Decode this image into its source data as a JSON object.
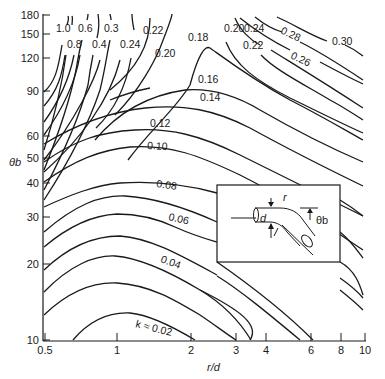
{
  "chart_data": {
    "type": "contour",
    "title": "",
    "xlabel": "r/d",
    "ylabel": "θb",
    "xscale": "log",
    "yscale": "log",
    "xlim": [
      0.5,
      10
    ],
    "ylim": [
      10,
      180
    ],
    "grid": false,
    "x_ticks": [
      {
        "value": 0.5,
        "label": "0.5",
        "px": 45
      },
      {
        "value": 1,
        "label": "1",
        "px": 117
      },
      {
        "value": 2,
        "label": "2",
        "px": 191
      },
      {
        "value": 3,
        "label": "3",
        "px": 236
      },
      {
        "value": 4,
        "label": "4",
        "px": 266
      },
      {
        "value": 6,
        "label": "6",
        "px": 311
      },
      {
        "value": 8,
        "label": "8",
        "px": 341
      },
      {
        "value": 10,
        "label": "10",
        "px": 365
      }
    ],
    "y_ticks": [
      {
        "value": 180,
        "label": "180",
        "py": 15
      },
      {
        "value": 150,
        "label": "150",
        "py": 34
      },
      {
        "value": 120,
        "label": "120",
        "py": 58
      },
      {
        "value": 90,
        "label": "90",
        "py": 91
      },
      {
        "value": 60,
        "label": "60",
        "py": 136
      },
      {
        "value": 50,
        "label": "50",
        "py": 158
      },
      {
        "value": 40,
        "label": "40",
        "py": 183
      },
      {
        "value": 30,
        "label": "30",
        "py": 217
      },
      {
        "value": 20,
        "label": "20",
        "py": 264
      },
      {
        "value": 10,
        "label": "10",
        "py": 340
      }
    ],
    "contour_levels": [
      0.02,
      0.04,
      0.06,
      0.08,
      0.1,
      0.12,
      0.14,
      0.16,
      0.18,
      0.2,
      0.22,
      0.24,
      0.26,
      0.28,
      0.3,
      0.3,
      0.4,
      0.6,
      0.8,
      1.0
    ],
    "series": [
      {
        "name": "k ≈ 0.02",
        "level": 0.02,
        "label": "k ≈ 0.02",
        "label_pos": [
          135,
          327
        ],
        "label_rot": 14,
        "path": "M73,340 C90,320 110,312 130,313 C150,315 175,328 195,340"
      },
      {
        "level": 0.04,
        "label": "0.04",
        "label_pos": [
          160,
          262
        ],
        "label_rot": 20,
        "path": "M44,292 C70,265 95,255 115,256 C140,258 170,272 200,290 C240,310 260,325 250,340"
      },
      {
        "level": 0.04,
        "label": "",
        "path": "M200,290 C225,305 240,322 251,340"
      },
      {
        "level": 0.06,
        "label": "0.06",
        "label_pos": [
          168,
          220
        ],
        "label_rot": 13,
        "path": "M44,247 C70,225 95,215 117,214 C140,214 160,220 175,227 C195,236 210,240 217,242"
      },
      {
        "level": 0.06,
        "label": "",
        "path": "M340,262 C355,270 360,285 363,295"
      },
      {
        "level": 0.06,
        "label": "",
        "path": "M217,262 C250,285 285,312 313,340"
      },
      {
        "level": 0.08,
        "label": "0.08",
        "label_pos": [
          156,
          187
        ],
        "label_rot": 8,
        "path": "M44,207 C70,195 95,185 120,183 C150,181 185,184 217,193"
      },
      {
        "level": 0.08,
        "label": "",
        "path": "M340,232 C350,240 357,250 363,258"
      },
      {
        "level": 0.1,
        "label": "0.10",
        "label_pos": [
          147,
          149
        ],
        "label_rot": 3,
        "path": "M44,182 C75,160 100,150 130,147 C170,144 200,156 240,175 C290,200 330,228 363,250"
      },
      {
        "level": 0.12,
        "label": "0.12",
        "label_pos": [
          150,
          127
        ],
        "label_rot": 0,
        "path": "M44,162 C75,140 100,132 135,130 C170,128 200,135 240,155 C290,180 330,200 363,216"
      },
      {
        "level": 0.14,
        "label": "0.14",
        "label_pos": [
          200,
          101
        ],
        "label_rot": 0,
        "path": "M44,144 C75,125 110,112 145,108 C185,104 215,110 250,128 C290,150 330,170 363,186"
      },
      {
        "level": 0.16,
        "label": "0.16",
        "label_pos": [
          198,
          83
        ],
        "label_rot": 0,
        "path": "M95,140 C120,110 150,95 185,90 C210,88 235,95 260,110 C300,133 335,150 363,162"
      },
      {
        "level": 0.18,
        "label": "0.18",
        "label_pos": [
          188,
          41
        ],
        "label_rot": 0,
        "path": "M128,160 C150,130 175,110 190,85 C198,55 205,45 210,48 C220,55 250,78 290,100 C325,118 345,130 363,140"
      },
      {
        "level": 0.2,
        "label": "0.20",
        "label_pos": [
          155,
          57
        ],
        "label_rot": 0,
        "path": "M110,90 C135,70 150,45 150,18"
      },
      {
        "level": 0.2,
        "label": "0.20",
        "label_pos": [
          224,
          32
        ],
        "label_rot": 0,
        "path": "M226,42 C235,65 255,80 290,98 C325,115 345,125 363,133"
      },
      {
        "level": 0.22,
        "label": "0.22",
        "label_pos": [
          143,
          34
        ],
        "label_rot": 0,
        "path": "M115,115 C140,90 155,60 160,48 C165,35 172,18 172,14"
      },
      {
        "level": 0.22,
        "label": "0.22",
        "label_pos": [
          243,
          49
        ],
        "label_rot": 0,
        "path": "M261,55 C275,70 305,85 330,100 C345,108 355,115 363,120"
      },
      {
        "level": 0.24,
        "label": "0.24",
        "label_pos": [
          120,
          48
        ],
        "label_rot": 0,
        "path": "M96,128 C120,105 128,75 131,58 M134,30 C133,25 132,18 132,14"
      },
      {
        "level": 0.24,
        "label": "0.24",
        "label_pos": [
          244,
          32
        ],
        "label_rot": 0,
        "path": "M235,18 C240,30 250,40 260,45 M271,50 C295,65 320,80 363,108"
      },
      {
        "level": 0.26,
        "label": "0.26",
        "label_pos": [
          290,
          58
        ],
        "label_rot": 25,
        "path": "M240,18 C255,30 270,40 290,50 M320,62 C335,70 350,78 363,84"
      },
      {
        "level": 0.28,
        "label": "0.28",
        "label_pos": [
          280,
          33
        ],
        "label_rot": 25,
        "path": "M255,17 C265,25 275,30 282,32 M300,42 C320,52 345,68 363,80"
      },
      {
        "level": 0.3,
        "label": "0.30",
        "label_pos": [
          332,
          45
        ],
        "label_rot": 0,
        "path": "M277,17 C295,25 310,35 327,41 M345,45 C352,48 358,52 363,56"
      },
      {
        "level": 0.3,
        "label": "0.3",
        "label_pos": [
          104,
          32
        ],
        "label_rot": 0,
        "path": "M44,200 C70,160 90,120 100,90 C105,70 108,48 110,40 M111,20 C111,17 110,15 110,14"
      },
      {
        "level": 0.4,
        "label": "0.4",
        "label_pos": [
          92,
          48
        ],
        "label_rot": 0,
        "path": "M44,190 C65,150 80,115 88,85 C90,70 92,60 93,55"
      },
      {
        "level": 0.4,
        "label": "",
        "path": "M98,14 C99,20 99,30 97,38"
      },
      {
        "level": 0.6,
        "label": "0.6",
        "label_pos": [
          78,
          32
        ],
        "label_rot": 0,
        "path": "M44,170 C60,130 70,100 76,70 C78,58 80,48 82,40 M87,20 C88,17 88,15 88,14"
      },
      {
        "level": 0.8,
        "label": "0.8",
        "label_pos": [
          67,
          48
        ],
        "label_rot": 0,
        "path": "M44,150 C55,115 62,85 66,55 M72,16 C73,18 72,22 72,25"
      },
      {
        "level": 1.0,
        "label": "1.0",
        "label_pos": [
          56,
          32
        ],
        "label_rot": 0,
        "path": "M44,92 C55,82 58,70 62,45 M68,16 C69,18 68,22 67,25"
      }
    ],
    "extra_curves": [
      "M44,106 C58,90 62,75 65,55",
      "M44,122 C60,100 70,75 74,55",
      "M44,135 C62,110 75,85 80,55",
      "M44,160 C75,120 95,80 100,60",
      "M44,172 C80,140 110,100 120,60",
      "M44,232 C75,205 100,195 125,196 C160,198 195,212 217,222",
      "M44,270 C70,245 95,236 120,236 C150,238 180,255 217,275",
      "M44,315 C70,290 95,282 117,283 C150,285 175,300 200,315 C215,325 225,333 236,340",
      "M217,276 C240,290 270,315 300,340",
      "M340,278 C350,285 358,292 363,298",
      "M340,290 C350,298 358,305 363,310",
      "M110,100 C130,92 140,90 150,88",
      "M340,200 C350,206 358,212 363,216"
    ],
    "inset": {
      "box": [
        217,
        185,
        123,
        77
      ],
      "labels": {
        "r": "r",
        "d": "d",
        "theta": "θb"
      }
    }
  }
}
